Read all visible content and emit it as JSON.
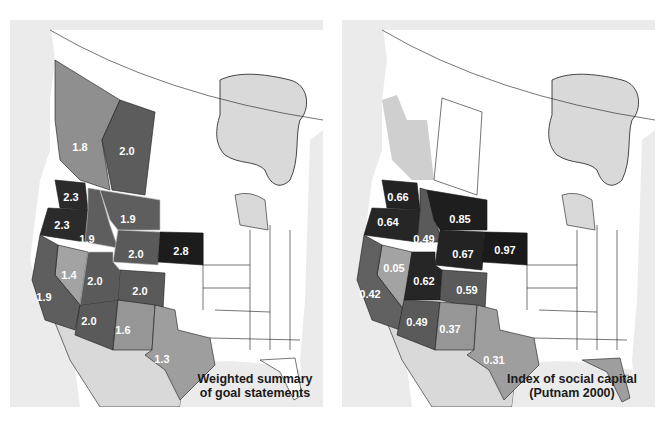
{
  "maps": [
    {
      "id": "left",
      "caption_line1": "Weighted summary",
      "caption_line2": "of goal statements",
      "regions": [
        {
          "name": "British Columbia",
          "value": "1.8",
          "shade": "#8f8f8f"
        },
        {
          "name": "Alberta",
          "value": "2.0",
          "shade": "#5c5c5c"
        },
        {
          "name": "Washington",
          "value": "2.3",
          "shade": "#2b2b2b"
        },
        {
          "name": "Oregon",
          "value": "2.3",
          "shade": "#2b2b2b"
        },
        {
          "name": "Idaho",
          "value": "1.9",
          "shade": "#5e5e5e"
        },
        {
          "name": "Montana",
          "value": "1.9",
          "shade": "#5e5e5e"
        },
        {
          "name": "Wyoming",
          "value": "2.0",
          "shade": "#5a5a5a"
        },
        {
          "name": "South Dakota",
          "value": "2.8",
          "shade": "#1c1c1c"
        },
        {
          "name": "Nevada",
          "value": "1.4",
          "shade": "#a3a3a3"
        },
        {
          "name": "California",
          "value": "1.9",
          "shade": "#5e5e5e"
        },
        {
          "name": "Utah",
          "value": "2.0",
          "shade": "#5a5a5a"
        },
        {
          "name": "Colorado",
          "value": "2.0",
          "shade": "#5a5a5a"
        },
        {
          "name": "Arizona",
          "value": "2.0",
          "shade": "#5a5a5a"
        },
        {
          "name": "New Mexico",
          "value": "1.6",
          "shade": "#969696"
        },
        {
          "name": "Texas",
          "value": "1.3",
          "shade": "#9e9e9e"
        }
      ]
    },
    {
      "id": "right",
      "caption_line1": "Index of social capital",
      "caption_line2": "(Putnam 2000)",
      "regions": [
        {
          "name": "British Columbia",
          "value": "",
          "shade": "#cfcfcf"
        },
        {
          "name": "Alberta",
          "value": "",
          "shade": "#ffffff"
        },
        {
          "name": "Washington",
          "value": "0.66",
          "shade": "#232323"
        },
        {
          "name": "Oregon",
          "value": "0.64",
          "shade": "#262626"
        },
        {
          "name": "Idaho",
          "value": "0.49",
          "shade": "#5a5a5a"
        },
        {
          "name": "Montana",
          "value": "0.85",
          "shade": "#1e1e1e"
        },
        {
          "name": "Wyoming",
          "value": "0.67",
          "shade": "#232323"
        },
        {
          "name": "South Dakota",
          "value": "0.97",
          "shade": "#1a1a1a"
        },
        {
          "name": "Nevada",
          "value": "0.05",
          "shade": "#a3a3a3"
        },
        {
          "name": "California",
          "value": "0.42",
          "shade": "#606060"
        },
        {
          "name": "Utah",
          "value": "0.62",
          "shade": "#262626"
        },
        {
          "name": "Colorado",
          "value": "0.59",
          "shade": "#5a5a5a"
        },
        {
          "name": "Arizona",
          "value": "0.49",
          "shade": "#5a5a5a"
        },
        {
          "name": "New Mexico",
          "value": "0.37",
          "shade": "#969696"
        },
        {
          "name": "Texas",
          "value": "0.31",
          "shade": "#9e9e9e"
        },
        {
          "name": "Florida",
          "value": "",
          "shade": "#9e9e9e"
        }
      ]
    }
  ],
  "colors": {
    "background_land_foreign": "#d9d9d9",
    "water": "#ebebeb",
    "unshaded_region": "#ffffff",
    "border": "#1a1a1a",
    "label_text": "#ffffff"
  }
}
